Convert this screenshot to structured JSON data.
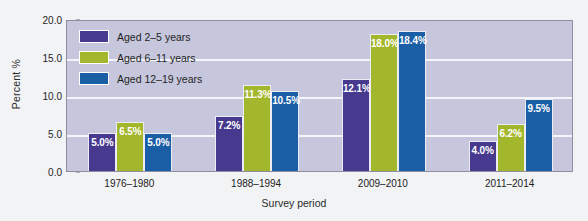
{
  "chart_data": {
    "type": "bar",
    "title": "",
    "subtitle": "",
    "xlabel": "Survey period",
    "ylabel": "Percent %",
    "categories": [
      "1976–1980",
      "1988–1994",
      "2009–2010",
      "2011–2014"
    ],
    "series": [
      {
        "name": "Aged 2–5 years",
        "color": "#473a8e",
        "values": [
          5.0,
          7.2,
          12.1,
          4.0
        ],
        "labels": [
          "5.0%",
          "7.2%",
          "12.1%",
          "4.0%"
        ]
      },
      {
        "name": "Aged 6–11 years",
        "color": "#a3b72c",
        "values": [
          6.5,
          11.3,
          18.0,
          6.2
        ],
        "labels": [
          "6.5%",
          "11.3%",
          "18.0%",
          "6.2%"
        ]
      },
      {
        "name": "Aged 12–19 years",
        "color": "#1a5ea6",
        "values": [
          5.0,
          10.5,
          18.4,
          9.5
        ],
        "labels": [
          "5.0%",
          "10.5%",
          "18.4%",
          "9.5%"
        ]
      }
    ],
    "ylim": [
      0.0,
      20.0
    ],
    "ytick_values": [
      0.0,
      5.0,
      10.0,
      15.0,
      20.0
    ],
    "ytick_labels": [
      "0.0",
      "5.0",
      "10.0",
      "15.0",
      "20.0"
    ],
    "grid": true,
    "gridline_values": [
      5.0,
      10.0,
      15.0
    ],
    "legend_position": "top-left",
    "plot_background": "#c6c7dc",
    "gridline_color": "#f4f4fa",
    "page_background": "#f2f3f5"
  }
}
